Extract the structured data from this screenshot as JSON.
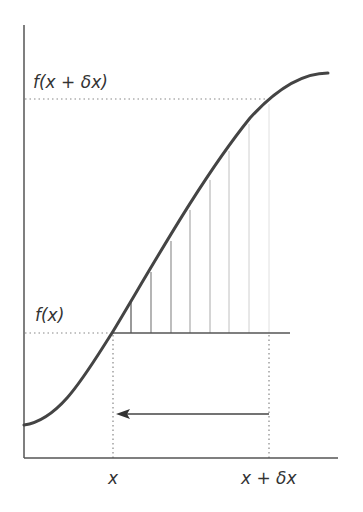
{
  "diagram": {
    "title": "",
    "labels": {
      "f_x_plus_dx": "f(x + δx)",
      "f_x": "f(x)",
      "x": "x",
      "x_plus_dx": "x + δx"
    },
    "colors": {
      "curve": "#444444",
      "axes": "#555555",
      "dotted": "#888888",
      "hatch_dark": "#555555",
      "hatch_light": "#dddddd"
    },
    "hatch_lines": [
      {
        "x": 131,
        "top": 300
      },
      {
        "x": 151,
        "top": 270
      },
      {
        "x": 171,
        "top": 239
      },
      {
        "x": 190,
        "top": 208
      },
      {
        "x": 210,
        "top": 177
      },
      {
        "x": 229,
        "top": 147
      },
      {
        "x": 249,
        "top": 120
      },
      {
        "x": 269,
        "top": 100
      }
    ]
  }
}
